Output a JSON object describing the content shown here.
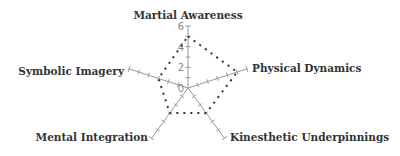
{
  "chart_data": {
    "type": "radar",
    "title": "",
    "axes": [
      "Martial Awareness",
      "Physical Dynamics",
      "Kinesthetic Underpinnings",
      "Mental Integration",
      "Symbolic Imagery"
    ],
    "series": [
      {
        "name": "Series 1",
        "values": [
          5,
          5,
          3,
          3,
          3
        ],
        "line_style": "dotted",
        "color": "#333333"
      }
    ],
    "radial_range": [
      0,
      6
    ],
    "radial_ticks": [
      0,
      2,
      4,
      6
    ],
    "grid": false,
    "legend": "none"
  },
  "colors": {
    "axis": "#999999",
    "series": "#333333",
    "label": "#333333",
    "tick_label": "#888888"
  }
}
